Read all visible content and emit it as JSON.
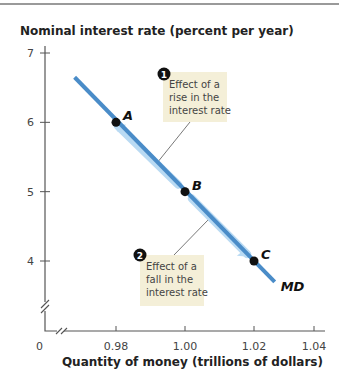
{
  "chart_data": {
    "type": "line",
    "title": "",
    "ylabel": "Nominal interest rate (percent per year)",
    "xlabel": "Quantity of money (trillions of dollars)",
    "ylim": [
      3.0,
      7.0
    ],
    "xlim": [
      0.96,
      1.04
    ],
    "y_ticks": [
      "7",
      "6",
      "5",
      "4"
    ],
    "y_tick_values": [
      7,
      6,
      5,
      4
    ],
    "x_ticks": [
      "0",
      "0.98",
      "1.00",
      "1.02",
      "1.04"
    ],
    "x_tick_values": [
      0.98,
      1.0,
      1.02,
      1.04
    ],
    "origin_label": "0",
    "axis_breaks": true,
    "grid": false,
    "series": [
      {
        "name": "MD",
        "label": "MD",
        "color": "#4a8cc8",
        "x": [
          0.968,
          1.026
        ],
        "y": [
          6.65,
          3.7
        ]
      }
    ],
    "points": [
      {
        "label": "A",
        "x": 0.98,
        "y": 6
      },
      {
        "label": "B",
        "x": 1.0,
        "y": 5
      },
      {
        "label": "C",
        "x": 1.02,
        "y": 4
      }
    ],
    "annotations": [
      {
        "number": "1",
        "text_lines": [
          "Effect of a",
          "rise in the",
          "interest rate"
        ],
        "arrow_direction": "up-left"
      },
      {
        "number": "2",
        "text_lines": [
          "Effect of a",
          "fall in the",
          "interest rate"
        ],
        "arrow_direction": "down-right"
      }
    ],
    "colors": {
      "curve": "#4a8cc8",
      "arrow_glow": "#b9daf3",
      "note_bg": "#f4efd8"
    }
  }
}
